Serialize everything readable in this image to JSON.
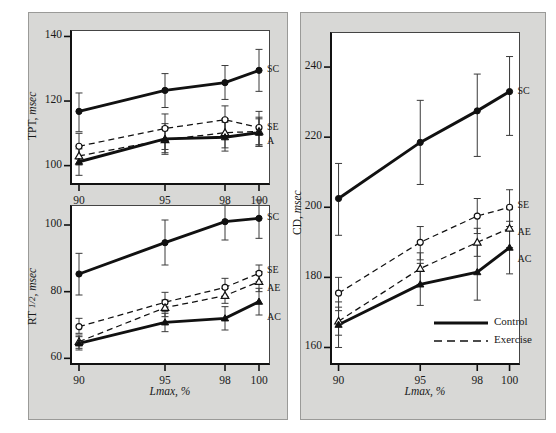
{
  "figure": {
    "background": "#d8d8d6",
    "plot_background": "#ffffff",
    "line_color": "#111111",
    "x_axis_label": "Lmax, %",
    "x_ticks": [
      "90",
      "95",
      "98",
      "100"
    ],
    "x_values": [
      90,
      95,
      98,
      100
    ],
    "legend": {
      "control_label": "Control",
      "exercise_label": "Exercise"
    }
  },
  "chart_data": [
    {
      "type": "line",
      "panel": "top-left",
      "title": "",
      "xlabel": "Lmax, %",
      "ylabel": "TPT, msec",
      "ylabel_prefix": "TPT,",
      "ylabel_unit": "msec",
      "xlim": [
        90,
        100
      ],
      "ylim": [
        94,
        142
      ],
      "yticks": [
        100,
        120,
        140
      ],
      "ytick_labels": [
        "100",
        "120",
        "140"
      ],
      "xticks": [
        90,
        95,
        98,
        100
      ],
      "xtick_labels": [
        "90",
        "95",
        "98",
        "100"
      ],
      "grid": false,
      "legend_position": "right-of-line-end",
      "series": [
        {
          "name": "SC",
          "label": "SC",
          "style": "solid",
          "marker": "filled-circle",
          "group": "Control",
          "values": [
            116.8,
            123.3,
            125.7,
            129.5
          ],
          "err_low": [
            110.5,
            118.0,
            120.5,
            123.0
          ],
          "err_high": [
            122.5,
            128.5,
            131.0,
            136.0
          ]
        },
        {
          "name": "SE",
          "label": "SE",
          "style": "dashed",
          "marker": "open-circle",
          "group": "Exercise",
          "values": [
            106.0,
            111.5,
            114.2,
            111.8
          ],
          "err_low": [
            102.0,
            105.0,
            109.0,
            106.5
          ],
          "err_high": [
            110.0,
            116.0,
            118.5,
            116.8
          ]
        },
        {
          "name": "AE",
          "label": "A",
          "style": "dashed",
          "marker": "open-triangle",
          "group": "Exercise",
          "values": [
            103.0,
            108.0,
            110.2,
            110.6
          ],
          "err_low": [
            100.2,
            104.0,
            105.5,
            106.0
          ],
          "err_high": [
            106.0,
            112.0,
            114.5,
            115.0
          ]
        },
        {
          "name": "AC",
          "label": "",
          "style": "solid",
          "marker": "filled-triangle",
          "group": "Control",
          "values": [
            101.2,
            108.3,
            108.8,
            110.2
          ],
          "err_low": [
            97.0,
            103.5,
            104.5,
            106.0
          ],
          "err_high": [
            105.2,
            113.0,
            113.5,
            114.5
          ]
        }
      ]
    },
    {
      "type": "line",
      "panel": "middle-left",
      "title": "",
      "xlabel": "Lmax, %",
      "ylabel": "RT 1/2, msec",
      "ylabel_prefix": "RT",
      "ylabel_frac": "1/2",
      "ylabel_unit": "msec",
      "xlim": [
        90,
        100
      ],
      "ylim": [
        58,
        106
      ],
      "yticks": [
        60,
        80,
        100
      ],
      "ytick_labels": [
        "60",
        "80",
        "100"
      ],
      "xticks": [
        90,
        95,
        98,
        100
      ],
      "xtick_labels": [
        "90",
        "95",
        "98",
        "100"
      ],
      "grid": false,
      "legend_position": "right-of-line-end",
      "series": [
        {
          "name": "SC",
          "label": "SC",
          "style": "solid",
          "marker": "filled-circle",
          "group": "Control",
          "values": [
            85.3,
            94.7,
            101.0,
            102.0
          ],
          "err_low": [
            79.0,
            88.0,
            95.5,
            96.0
          ],
          "err_high": [
            91.5,
            101.5,
            106.0,
            107.5
          ]
        },
        {
          "name": "SE",
          "label": "SE",
          "style": "dashed",
          "marker": "open-circle",
          "group": "Exercise",
          "values": [
            69.5,
            76.8,
            81.3,
            85.5
          ],
          "err_low": [
            67.5,
            74.0,
            78.5,
            83.0
          ],
          "err_high": [
            72.0,
            79.8,
            84.0,
            88.0
          ]
        },
        {
          "name": "AE",
          "label": "AE",
          "style": "dashed",
          "marker": "open-triangle",
          "group": "Exercise",
          "values": [
            65.0,
            75.2,
            78.8,
            83.0
          ],
          "err_low": [
            63.0,
            72.5,
            76.5,
            80.0
          ],
          "err_high": [
            67.0,
            77.5,
            81.0,
            86.0
          ]
        },
        {
          "name": "AC",
          "label": "AC",
          "style": "solid",
          "marker": "filled-triangle",
          "group": "Control",
          "values": [
            64.5,
            70.8,
            72.0,
            77.0
          ],
          "err_low": [
            62.5,
            68.0,
            68.5,
            73.0
          ],
          "err_high": [
            66.5,
            73.5,
            75.5,
            81.0
          ]
        }
      ]
    },
    {
      "type": "line",
      "panel": "right",
      "title": "",
      "xlabel": "Lmax, %",
      "ylabel": "CD, msec",
      "ylabel_prefix": "CD,",
      "ylabel_unit": "msec",
      "xlim": [
        90,
        100
      ],
      "ylim": [
        155,
        250
      ],
      "yticks": [
        160,
        180,
        200,
        220,
        240
      ],
      "ytick_labels": [
        "160",
        "180",
        "200",
        "220",
        "240"
      ],
      "xticks": [
        90,
        95,
        98,
        100
      ],
      "xtick_labels": [
        "90",
        "95",
        "98",
        "100"
      ],
      "grid": false,
      "legend_position": "inside-lower-right",
      "series": [
        {
          "name": "SC",
          "label": "SC",
          "style": "solid",
          "marker": "filled-circle",
          "group": "Control",
          "values": [
            202.5,
            218.5,
            227.5,
            233.0
          ],
          "err_low": [
            192.0,
            206.5,
            214.5,
            220.5
          ],
          "err_high": [
            212.5,
            230.5,
            238.0,
            243.0
          ]
        },
        {
          "name": "SE",
          "label": "SE",
          "style": "dashed",
          "marker": "open-circle",
          "group": "Exercise",
          "values": [
            175.5,
            190.0,
            197.5,
            200.0
          ],
          "err_low": [
            170.5,
            185.0,
            192.5,
            194.5
          ],
          "err_high": [
            180.0,
            194.5,
            202.5,
            205.0
          ]
        },
        {
          "name": "AE",
          "label": "AE",
          "style": "dashed",
          "marker": "open-triangle",
          "group": "Exercise",
          "values": [
            167.5,
            182.5,
            190.0,
            194.0
          ],
          "err_low": [
            163.5,
            178.0,
            186.0,
            188.5
          ],
          "err_high": [
            171.5,
            187.0,
            194.0,
            199.5
          ]
        },
        {
          "name": "AC",
          "label": "AC",
          "style": "solid",
          "marker": "filled-triangle",
          "group": "Control",
          "values": [
            166.5,
            178.0,
            181.5,
            188.5
          ],
          "err_low": [
            160.0,
            172.0,
            173.5,
            181.0
          ],
          "err_high": [
            173.0,
            184.0,
            189.5,
            196.0
          ]
        }
      ]
    }
  ]
}
